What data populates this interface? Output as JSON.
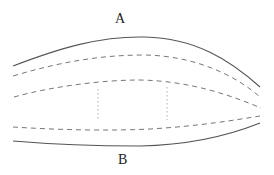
{
  "diagram": {
    "labels": {
      "top": "A",
      "bottom": "B"
    },
    "colors": {
      "solid_line": "#555555",
      "dashed_line": "#777777",
      "dotted_line": "#999999",
      "background": "#ffffff"
    },
    "curves": [
      {
        "id": "outer-top",
        "style": "solid",
        "d": "M13,66 C60,48 100,36 145,37 C195,38 230,60 260,87"
      },
      {
        "id": "inner-top",
        "style": "dashed",
        "d": "M13,76 C60,62 100,55 145,55 C195,56 235,75 260,97"
      },
      {
        "id": "inner-middle",
        "style": "dashed",
        "d": "M14,97 C50,87 100,80 140,80 C190,81 230,95 261,108"
      },
      {
        "id": "inner-bottom",
        "style": "dashed",
        "d": "M13,127 C60,130 110,131 150,129 C200,126 235,120 260,116"
      },
      {
        "id": "outer-bottom",
        "style": "solid",
        "d": "M13,141 C60,145 100,146 140,146 C190,145 230,135 260,123"
      }
    ],
    "verticals": [
      {
        "id": "divider-left",
        "x": 98,
        "y1": 89,
        "y2": 120
      },
      {
        "id": "divider-right",
        "x": 167,
        "y1": 87,
        "y2": 120
      }
    ]
  }
}
